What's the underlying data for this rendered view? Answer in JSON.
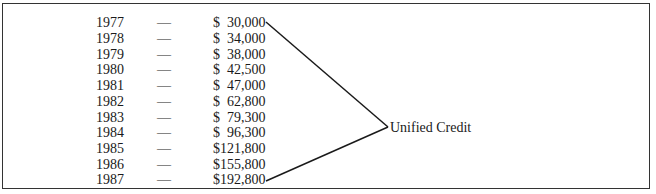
{
  "table": {
    "rows": [
      {
        "year": "1977",
        "dash": "—",
        "amount": "$  30,000"
      },
      {
        "year": "1978",
        "dash": "—",
        "amount": "$  34,000"
      },
      {
        "year": "1979",
        "dash": "—",
        "amount": "$  38,000"
      },
      {
        "year": "1980",
        "dash": "—",
        "amount": "$  42,500"
      },
      {
        "year": "1981",
        "dash": "—",
        "amount": "$  47,000"
      },
      {
        "year": "1982",
        "dash": "—",
        "amount": "$  62,800"
      },
      {
        "year": "1983",
        "dash": "—",
        "amount": "$  79,300"
      },
      {
        "year": "1984",
        "dash": "—",
        "amount": "$  96,300"
      },
      {
        "year": "1985",
        "dash": "—",
        "amount": "$121,800"
      },
      {
        "year": "1986",
        "dash": "—",
        "amount": "$155,800"
      },
      {
        "year": "1987",
        "dash": "—",
        "amount": "$192,800"
      }
    ]
  },
  "bracket_label": "Unified Credit",
  "colors": {
    "border": "#333333",
    "text": "#1a1a1a",
    "background": "#ffffff"
  }
}
